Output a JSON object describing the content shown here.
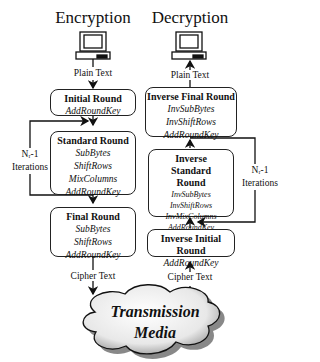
{
  "encryption": {
    "title": "Encryption",
    "input_label": "Plain Text",
    "output_label": "Cipher Text",
    "iterations_label": [
      "Nᵣ-1",
      "Iterations"
    ],
    "boxes": [
      {
        "heading": "Initial Round",
        "steps": [
          "AddRoundKey"
        ]
      },
      {
        "heading": "Standard Round",
        "steps": [
          "SubBytes",
          "ShiftRows",
          "MixColumns",
          "AddRoundKey"
        ]
      },
      {
        "heading": "Final Round",
        "steps": [
          "SubBytes",
          "ShiftRows",
          "AddRoundKey"
        ]
      }
    ]
  },
  "decryption": {
    "title": "Decryption",
    "input_label": "Cipher Text",
    "output_label": "Plain Text",
    "iterations_label": [
      "Nᵣ-1",
      "Iterations"
    ],
    "boxes": [
      {
        "heading": "Inverse Final Round",
        "steps": [
          "InvSubBytes",
          "InvShiftRows",
          "AddRoundKey"
        ]
      },
      {
        "heading": "Inverse Standard Round",
        "steps": [
          "InvSubBytes",
          "InvShiftRows",
          "InvMixColumns",
          "AddRoundKey"
        ]
      },
      {
        "heading": "Inverse Initial Round",
        "steps": [
          "AddRoundKey"
        ]
      }
    ]
  },
  "media": {
    "line1": "Transmission",
    "line2": "Media"
  }
}
